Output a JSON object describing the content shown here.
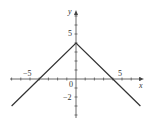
{
  "chart_data": {
    "type": "line",
    "title": "",
    "xlabel": "x",
    "ylabel": "y",
    "function": "y = 4 - |x|",
    "series": [
      {
        "name": "y = 4 - |x|",
        "x": [
          -7,
          -4,
          0,
          4,
          7
        ],
        "y": [
          -3,
          0,
          4,
          0,
          -3
        ],
        "color": "#333333"
      }
    ],
    "xlim": [
      -7.2,
      7.3
    ],
    "ylim": [
      -4.3,
      7.4
    ],
    "x_tick_step": 1,
    "y_tick_step": 1,
    "x_tick_labels": [
      {
        "value": -5,
        "label": "−5"
      },
      {
        "value": 5,
        "label": "5"
      }
    ],
    "y_tick_labels": [
      {
        "value": 5,
        "label": "5"
      },
      {
        "value": -2,
        "label": "−2"
      }
    ],
    "origin_label": "0",
    "grid": false,
    "legend": "none"
  },
  "labels": {
    "x_axis": "x",
    "y_axis": "y",
    "origin": "0",
    "x_neg5": "−5",
    "x_pos5": "5",
    "y_pos5": "5",
    "y_neg2": "−2"
  },
  "colors": {
    "axis": "#444444",
    "curve": "#333333",
    "text": "#333333"
  }
}
